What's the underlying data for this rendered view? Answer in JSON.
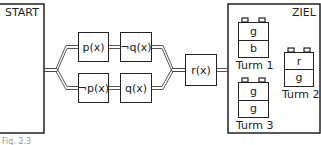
{
  "start": {
    "label": "START"
  },
  "goal": {
    "label": "ZIEL"
  },
  "conditions": {
    "upper": [
      {
        "label": "p(x)"
      },
      {
        "label": "¬q(x)"
      }
    ],
    "lower": [
      {
        "label": "¬p(x)"
      },
      {
        "label": "q(x)"
      }
    ],
    "merge": {
      "label": "r(x)"
    }
  },
  "towers": [
    {
      "label": "Turm 1",
      "blocks": [
        "g",
        "b"
      ]
    },
    {
      "label": "Turm 2",
      "blocks": [
        "r",
        "g"
      ]
    },
    {
      "label": "Turm 3",
      "blocks": [
        "g",
        "g"
      ]
    }
  ],
  "caption": "Fig. 2.3"
}
